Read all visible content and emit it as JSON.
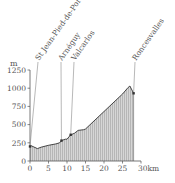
{
  "chart_data": {
    "type": "area",
    "title": "",
    "xlabel": "km",
    "ylabel": "m",
    "xlim": [
      0,
      30
    ],
    "ylim": [
      0,
      1250
    ],
    "x_ticks": [
      "0",
      "5",
      "10",
      "15",
      "20",
      "25",
      "30km"
    ],
    "y_ticks": [
      "0",
      "250",
      "500",
      "750",
      "1000",
      "1250"
    ],
    "y_unit_label": "m",
    "grid": false,
    "fill": "vertical hatching, grey",
    "series": [
      {
        "name": "elevation",
        "x": [
          0,
          0.3,
          2,
          3,
          5,
          7,
          8,
          8.5,
          9.5,
          10,
          11,
          12,
          13,
          14.5,
          15,
          20,
          25,
          26.5,
          27,
          28
        ],
        "values": [
          200,
          210,
          170,
          190,
          215,
          235,
          250,
          280,
          300,
          300,
          360,
          380,
          420,
          430,
          440,
          680,
          920,
          1010,
          1030,
          930
        ]
      }
    ],
    "annotations": [
      {
        "label": "St Jean-Pied-de-Port",
        "x": 0,
        "y": 200
      },
      {
        "label": "Arnéguy",
        "x": 8.5,
        "y": 280
      },
      {
        "label": "Valcarlos",
        "x": 11,
        "y": 360
      },
      {
        "label": "Roncesvalles",
        "x": 28,
        "y": 930
      }
    ]
  },
  "colors": {
    "line": "#333333",
    "fill": "#cfcfcf",
    "hatch": "#a8a8a8",
    "axis": "#555555",
    "leader": "#888888"
  }
}
